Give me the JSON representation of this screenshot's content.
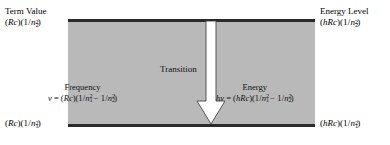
{
  "figure": {
    "type": "energy-level-transition-diagram",
    "title": "",
    "box": {
      "fill_color": "#b9b9b9",
      "line_color": "#2b2b2b"
    },
    "arrow": {
      "name": "transition-arrow",
      "direction": "down",
      "fill_color": "#ffffff",
      "stroke_color": "#4a4a4a"
    }
  },
  "labels": {
    "top_left": {
      "title": "Term Value",
      "expression": "(Rc)(1/n₂²)",
      "expr_parts": {
        "lead": "(",
        "R": "R",
        "c": "c",
        "mid": ")(1/",
        "n": "n",
        "sub": "2",
        "sup": "2",
        "tail": ")"
      }
    },
    "bottom_left": {
      "title": "",
      "expression": "(Rc)(1/n₁²)",
      "expr_parts": {
        "lead": "(",
        "R": "R",
        "c": "c",
        "mid": ")(1/",
        "n": "n",
        "sub": "1",
        "sup": "2",
        "tail": ")"
      }
    },
    "top_right": {
      "title": "Energy Level",
      "expression": "(hRc)(1/n₂²)",
      "expr_parts": {
        "lead": "(",
        "h": "h",
        "R": "R",
        "c": "c",
        "mid": ")(1/",
        "n": "n",
        "sub": "2",
        "sup": "2",
        "tail": ")"
      }
    },
    "bottom_right": {
      "title": "",
      "expression": "(hRc)(1/n₁²)",
      "expr_parts": {
        "lead": "(",
        "h": "h",
        "R": "R",
        "c": "c",
        "mid": ")(1/",
        "n": "n",
        "sub": "1",
        "sup": "2",
        "tail": ")"
      }
    }
  },
  "inner": {
    "transition": "Transition",
    "frequency": {
      "title": "Frequency",
      "expression": "ν = (Rc)(1/n₁² − 1/n₂²)",
      "lhs": "ν",
      "equals": "=",
      "rhs_lead": "(",
      "R": "R",
      "c": "c",
      "rhs_mid": ")(1/",
      "n": "n",
      "sub1": "1",
      "sup1": "2",
      "minus": "−",
      "rhs_mid2": "1/",
      "sub2": "2",
      "sup2": "2",
      "tail": ")"
    },
    "energy": {
      "title": "Energy",
      "expression": "hν = (hRc)(1/n₁² − 1/n₂²)",
      "lhs_h": "h",
      "lhs_nu": "ν",
      "equals": "=",
      "rhs_lead": "(",
      "h": "h",
      "R": "R",
      "c": "c",
      "rhs_mid": ")(1/",
      "n": "n",
      "sub1": "1",
      "sup1": "2",
      "minus": "−",
      "rhs_mid2": "1/",
      "sub2": "2",
      "sup2": "2",
      "tail": ")"
    }
  }
}
